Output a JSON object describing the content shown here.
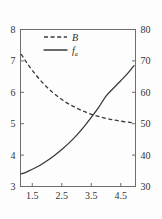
{
  "figure": {
    "background_color": "#fdfdfd",
    "ink_color": "#3a3a3a",
    "axis_color": "#6e6e6e"
  },
  "chart_data": {
    "type": "line",
    "title": "",
    "subtitle": "",
    "xlabel": "",
    "ylabel": "",
    "y2label": "",
    "grid": false,
    "legend_position": "top-center",
    "xlim": [
      1.1,
      5.0
    ],
    "ylim": [
      3,
      8
    ],
    "y2lim": [
      30,
      80
    ],
    "xticks": [
      1.5,
      2.5,
      3.5,
      4.5
    ],
    "xtick_labels": [
      "1.5",
      "2.5",
      "3.5",
      "4.5"
    ],
    "yticks": [
      3,
      4,
      5,
      6,
      7,
      8
    ],
    "ytick_labels": [
      "3",
      "4",
      "5",
      "6",
      "7",
      "8"
    ],
    "y2ticks": [
      30,
      40,
      50,
      60,
      70,
      80
    ],
    "y2tick_labels": [
      "30",
      "40",
      "50",
      "60",
      "70",
      "80"
    ],
    "series": [
      {
        "name": "B",
        "legend_label": "B",
        "legend_subscript": "",
        "style": "dashed",
        "axis": "right",
        "x": [
          1.12,
          1.3,
          1.5,
          1.75,
          2.0,
          2.25,
          2.5,
          2.75,
          3.0,
          3.25,
          3.5,
          3.75,
          4.0,
          4.25,
          4.5,
          4.75,
          4.95
        ],
        "values": [
          72.2,
          69.6,
          67.0,
          64.1,
          61.6,
          59.5,
          57.7,
          56.2,
          55.0,
          53.9,
          53.0,
          52.3,
          51.7,
          51.2,
          50.8,
          50.5,
          50.3
        ]
      },
      {
        "name": "f_a",
        "legend_label": "f",
        "legend_subscript": "a",
        "style": "solid",
        "axis": "left",
        "x": [
          1.12,
          1.3,
          1.5,
          1.75,
          2.0,
          2.25,
          2.5,
          2.75,
          3.0,
          3.25,
          3.5,
          3.75,
          4.0,
          4.25,
          4.5,
          4.75,
          4.95
        ],
        "values": [
          3.4,
          3.46,
          3.55,
          3.67,
          3.82,
          3.99,
          4.18,
          4.39,
          4.63,
          4.9,
          5.2,
          5.52,
          5.88,
          6.13,
          6.37,
          6.62,
          6.85
        ]
      }
    ],
    "annotations": []
  },
  "legend": {
    "entries": [
      {
        "label": "B",
        "subscript": "",
        "style": "dashed"
      },
      {
        "label": "f",
        "subscript": "a",
        "style": "solid"
      }
    ]
  }
}
